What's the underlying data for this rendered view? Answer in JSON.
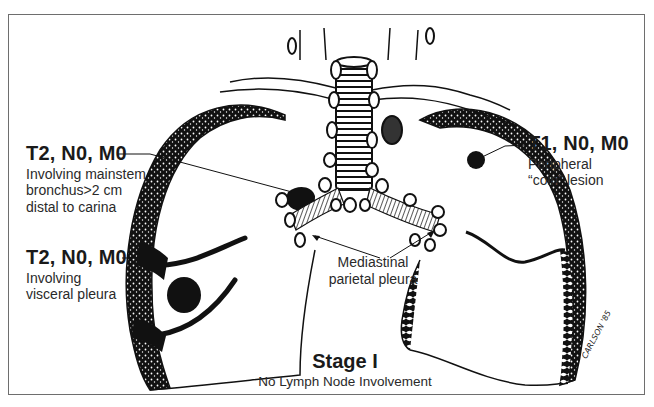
{
  "figure": {
    "frame_color": "#6e6e6e",
    "ink_color": "#111111",
    "background": "#ffffff"
  },
  "annotations": {
    "mainstem": {
      "code": "T2, N0, M0",
      "lines": [
        "Involving mainstem",
        "bronchus>2 cm",
        "distal to carina"
      ]
    },
    "visceral": {
      "code": "T2, N0, M0",
      "lines": [
        "Involving",
        "visceral pleura"
      ]
    },
    "peripheral": {
      "code": "T1, N0, M0",
      "lines": [
        "Peripheral",
        "“coin” lesion"
      ]
    },
    "mediastinal": {
      "lines": [
        "Mediastinal",
        "parietal pleura"
      ]
    }
  },
  "caption": {
    "title": "Stage I",
    "subtitle": "No Lymph Node Involvement"
  },
  "signature": "CARLSON '85"
}
